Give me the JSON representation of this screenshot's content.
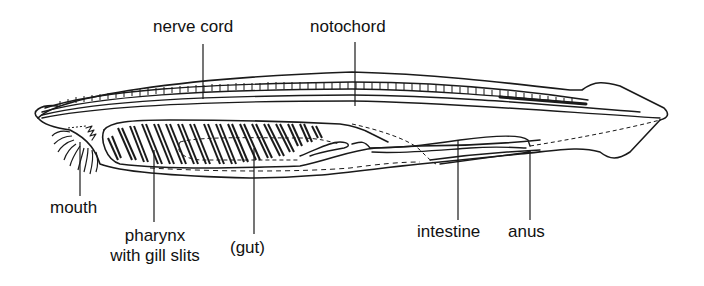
{
  "diagram": {
    "labels": {
      "nerve_cord": "nerve cord",
      "notochord": "notochord",
      "mouth": "mouth",
      "pharynx_line1": "pharynx",
      "pharynx_line2": "with gill slits",
      "gut": "(gut)",
      "intestine": "intestine",
      "anus": "anus"
    },
    "colors": {
      "ink": "#1a1a1a",
      "background": "#ffffff"
    }
  }
}
